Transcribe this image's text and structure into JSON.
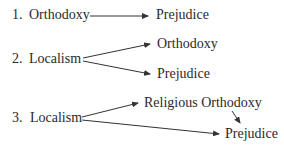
{
  "models": [
    {
      "number": "1.",
      "source": "Orthodoxy",
      "targets": [
        "Prejudice"
      ]
    },
    {
      "number": "2.",
      "source": "Localism",
      "targets": [
        "Orthodoxy",
        "Prejudice"
      ]
    },
    {
      "number": "3.",
      "source": "Localism",
      "targets": [
        "Religious Orthodoxy",
        "Prejudice"
      ],
      "mediated": "Religious Orthodoxy → Prejudice"
    }
  ],
  "m1": {
    "num": "1.",
    "src": "Orthodoxy",
    "dst": "Prejudice"
  },
  "m2": {
    "num": "2.",
    "src": "Localism",
    "dst_top": "Orthodoxy",
    "dst_bottom": "Prejudice"
  },
  "m3": {
    "num": "3.",
    "src": "Localism",
    "dst_top": "Religious Orthodoxy",
    "dst_bottom": "Prejudice"
  },
  "colors": {
    "text": "#2a2a2a",
    "arrow": "#333333"
  }
}
